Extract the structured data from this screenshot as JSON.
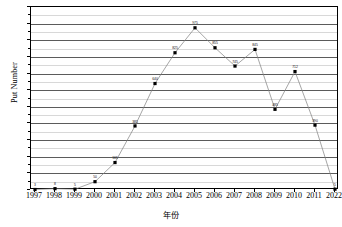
{
  "chart_data": {
    "type": "line",
    "title": "",
    "xlabel": "年份",
    "ylabel": "Put Number",
    "categories": [
      "1997",
      "1998",
      "1999",
      "2000",
      "2001",
      "2002",
      "2003",
      "2004",
      "2005",
      "2006",
      "2007",
      "2008",
      "2009",
      "2010",
      "2011",
      "2022"
    ],
    "values": [
      3,
      8,
      5,
      50,
      165,
      385,
      640,
      825,
      975,
      855,
      745,
      845,
      485,
      712,
      390,
      5
    ],
    "point_labels": [
      "3",
      "8",
      "5",
      "50",
      "165",
      "385",
      "640",
      "825",
      "975",
      "855",
      "745",
      "845",
      "485",
      "712",
      "390",
      "5"
    ],
    "ylim": [
      0,
      1100
    ],
    "yticks": [
      0,
      100,
      200,
      300,
      400,
      500,
      600,
      700,
      800,
      900,
      1000,
      1100
    ],
    "ytick_labels": [
      "0",
      "100",
      "200",
      "300",
      "400",
      "500",
      "600",
      "700",
      "800",
      "900",
      "1000",
      "1100"
    ],
    "minor_yticks": [
      50,
      150,
      250,
      350,
      450,
      550,
      650,
      750,
      850,
      950,
      1050
    ],
    "grid": true,
    "legend": false,
    "series_color": "#808080",
    "marker_color": "#000000",
    "grid_major_color": "#5b5b5b",
    "grid_minor_color": "#d8d8d8",
    "axis_color": "#000000"
  }
}
